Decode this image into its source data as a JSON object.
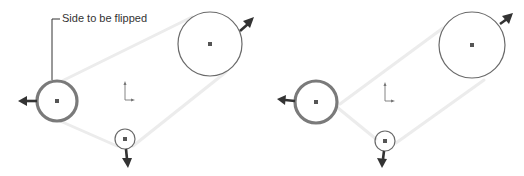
{
  "callout": {
    "label": "Side to be flipped"
  },
  "colors": {
    "belt": "#ececec",
    "pulley_stroke": "#6a6a6a",
    "arrow": "#333333"
  },
  "diagrams": [
    {
      "name": "before-flip",
      "pulleys": [
        {
          "id": "large",
          "cx": 210,
          "cy": 44,
          "r": 32,
          "style": "thin"
        },
        {
          "id": "left-selected",
          "cx": 57,
          "cy": 101,
          "r": 20,
          "style": "thick"
        },
        {
          "id": "small",
          "cx": 125,
          "cy": 139,
          "r": 10,
          "style": "thin"
        }
      ]
    },
    {
      "name": "after-flip",
      "pulleys": [
        {
          "id": "large",
          "cx": 472,
          "cy": 45,
          "r": 33,
          "style": "thin"
        },
        {
          "id": "left-selected",
          "cx": 316,
          "cy": 102,
          "r": 21,
          "style": "thick"
        },
        {
          "id": "small",
          "cx": 385,
          "cy": 141,
          "r": 10,
          "style": "thin"
        }
      ]
    }
  ]
}
